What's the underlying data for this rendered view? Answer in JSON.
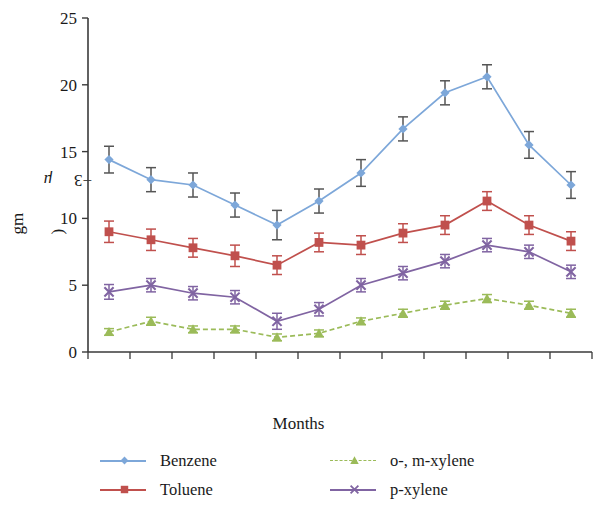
{
  "chart_data": {
    "type": "line",
    "title": "",
    "xlabel": "Months",
    "ylabel": "Concentration (μgm⁻³)",
    "ylabel_parts": {
      "main": "Concentration (",
      "unit_italic": "μ",
      "unit": "gm",
      "exponent": "−3",
      "close": ")"
    },
    "categories": [
      "Apr",
      "May",
      "Jun",
      "Jul",
      "Aug",
      "Sept",
      "Oct",
      "Nov",
      "Dec",
      "Jan",
      "Feb",
      "Mar"
    ],
    "ylim": [
      0,
      25
    ],
    "yticks": [
      0,
      5,
      10,
      15,
      20,
      25
    ],
    "ytick_labels": [
      "0",
      "5",
      "10",
      "15",
      "20",
      "25"
    ],
    "grid": false,
    "legend_position": "bottom",
    "errorbars": true,
    "series": [
      {
        "name": "Benzene",
        "color": "#7DA7D9",
        "marker": "diamond",
        "linestyle": "solid",
        "values": [
          14.4,
          12.9,
          12.5,
          11.0,
          9.5,
          11.3,
          13.4,
          16.7,
          19.4,
          20.6,
          15.5,
          12.5
        ],
        "errors": [
          1.0,
          0.9,
          0.9,
          0.9,
          1.1,
          0.9,
          1.0,
          0.9,
          0.9,
          0.9,
          1.0,
          1.0
        ]
      },
      {
        "name": "Toluene",
        "color": "#C0504D",
        "marker": "square",
        "linestyle": "solid",
        "values": [
          9.0,
          8.4,
          7.8,
          7.2,
          6.5,
          8.2,
          8.0,
          8.9,
          9.5,
          11.3,
          9.5,
          8.3
        ],
        "errors": [
          0.8,
          0.8,
          0.7,
          0.8,
          0.7,
          0.7,
          0.7,
          0.7,
          0.7,
          0.7,
          0.7,
          0.7
        ]
      },
      {
        "name": "o-, m-xylene",
        "color": "#9BBB59",
        "marker": "triangle",
        "linestyle": "dashed",
        "values": [
          1.5,
          2.3,
          1.7,
          1.7,
          1.1,
          1.4,
          2.3,
          2.9,
          3.5,
          4.0,
          3.5,
          2.9
        ],
        "errors": [
          0.25,
          0.3,
          0.25,
          0.25,
          0.25,
          0.25,
          0.25,
          0.3,
          0.3,
          0.3,
          0.3,
          0.3
        ]
      },
      {
        "name": "p-xylene",
        "color": "#8064A2",
        "marker": "x",
        "linestyle": "solid",
        "values": [
          4.5,
          5.0,
          4.4,
          4.1,
          2.3,
          3.2,
          5.0,
          5.9,
          6.8,
          8.0,
          7.5,
          6.0
        ],
        "errors": [
          0.55,
          0.5,
          0.5,
          0.5,
          0.6,
          0.5,
          0.5,
          0.5,
          0.5,
          0.5,
          0.5,
          0.5
        ]
      }
    ]
  },
  "legend": {
    "entries": [
      {
        "label": "Benzene",
        "color": "#7DA7D9",
        "marker": "diamond",
        "linestyle": "solid"
      },
      {
        "label": "o-, m-xylene",
        "color": "#9BBB59",
        "marker": "triangle",
        "linestyle": "dashed"
      },
      {
        "label": "Toluene",
        "color": "#C0504D",
        "marker": "square",
        "linestyle": "solid"
      },
      {
        "label": "p-xylene",
        "color": "#8064A2",
        "marker": "x",
        "linestyle": "solid"
      }
    ]
  }
}
